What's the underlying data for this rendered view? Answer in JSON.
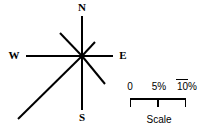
{
  "figure": {
    "type": "wind-rose-with-scale",
    "background_color": "#ffffff",
    "stroke_color": "#000000"
  },
  "compass": {
    "center": {
      "x": 82,
      "y": 56
    },
    "labels": {
      "north": "N",
      "south": "S",
      "west": "W",
      "east": "E"
    },
    "rays": [
      {
        "name": "north",
        "direction": "N",
        "angle_deg": 0,
        "end_x": 82,
        "end_y": 16,
        "length_px": 40,
        "width_px": 2
      },
      {
        "name": "northeast",
        "direction": "NE",
        "angle_deg": 45,
        "end_x": 95,
        "end_y": 42,
        "length_px": 19,
        "width_px": 2
      },
      {
        "name": "east",
        "direction": "E",
        "angle_deg": 90,
        "end_x": 113,
        "end_y": 56,
        "length_px": 31,
        "width_px": 2
      },
      {
        "name": "southeast",
        "direction": "SE",
        "angle_deg": 135,
        "end_x": 105,
        "end_y": 84,
        "length_px": 35,
        "width_px": 2
      },
      {
        "name": "south",
        "direction": "S",
        "angle_deg": 180,
        "end_x": 82,
        "end_y": 110,
        "length_px": 54,
        "width_px": 2
      },
      {
        "name": "southwest",
        "direction": "SW",
        "angle_deg": 225,
        "end_x": 18,
        "end_y": 119,
        "length_px": 89,
        "width_px": 2
      },
      {
        "name": "west",
        "direction": "W",
        "angle_deg": 270,
        "end_x": 26,
        "end_y": 56,
        "length_px": 56,
        "width_px": 2
      },
      {
        "name": "northwest",
        "direction": "NW",
        "angle_deg": 315,
        "end_x": 60,
        "end_y": 33,
        "length_px": 32,
        "width_px": 2
      }
    ]
  },
  "scale_bar": {
    "caption": "Scale",
    "unit": "%",
    "ticks": [
      {
        "label": "0",
        "value": 0,
        "x": 130
      },
      {
        "label": "5%",
        "value": 5,
        "x": 158
      },
      {
        "label": "10%",
        "value": 10,
        "x": 186
      }
    ],
    "bar": {
      "x_start": 130,
      "x_end": 186,
      "y": 99,
      "tick_height": 8
    },
    "overline_mark": {
      "x_start": 176,
      "x_end": 188,
      "y": 79
    }
  },
  "chart_data": {
    "type": "bar",
    "title": "",
    "xlabel": "Direction",
    "ylabel": "Frequency (%)",
    "ylim": [
      0,
      10
    ],
    "categories": [
      "N",
      "NE",
      "E",
      "SE",
      "S",
      "SW",
      "W",
      "NW"
    ],
    "values": [
      4.5,
      2.1,
      3.5,
      3.9,
      6.1,
      10.0,
      6.3,
      3.6
    ],
    "legend": [],
    "grid": false
  }
}
